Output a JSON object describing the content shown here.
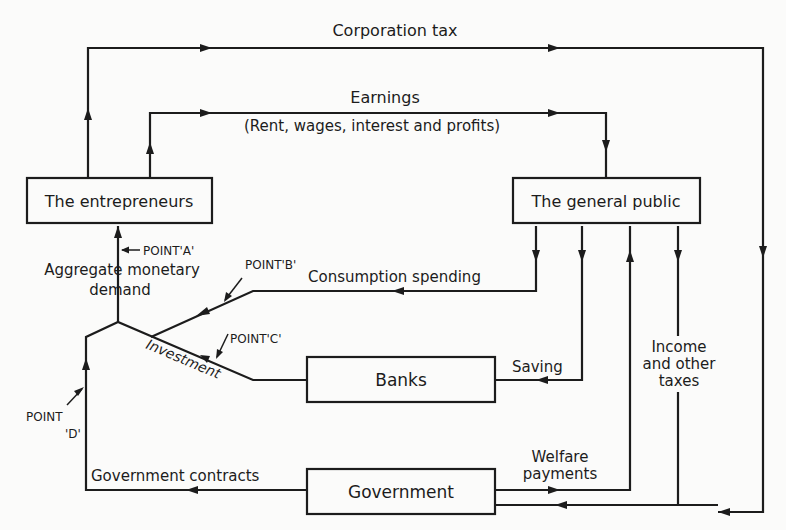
{
  "diagram": {
    "type": "circular-flow-of-income",
    "nodes": {
      "entrepreneurs": "The entrepreneurs",
      "public": "The general public",
      "banks": "Banks",
      "government": "Government"
    },
    "flows": {
      "corporation_tax": "Corporation tax",
      "earnings": "Earnings",
      "earnings_detail": "(Rent, wages, interest and profits)",
      "consumption": "Consumption spending",
      "saving": "Saving",
      "investment": "Investment",
      "income_taxes_1": "Income",
      "income_taxes_2": "and other",
      "income_taxes_3": "taxes",
      "welfare_1": "Welfare",
      "welfare_2": "payments",
      "gov_contracts": "Government contracts",
      "aggregate_1": "Aggregate monetary",
      "aggregate_2": "demand"
    },
    "points": {
      "a": "POINT'A'",
      "b": "POINT'B'",
      "c": "POINT'C'",
      "d1": "POINT",
      "d2": "'D'"
    },
    "colors": {
      "ink": "#1c1c1c",
      "paper": "#fbfbfa"
    }
  }
}
